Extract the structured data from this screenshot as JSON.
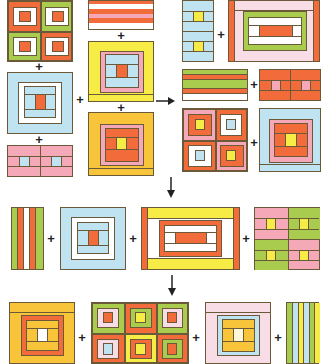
{
  "diagram": {
    "colors": {
      "orange": "#f26b3a",
      "green": "#a9cc4e",
      "white": "#ffffff",
      "pink": "#f5a9b8",
      "lightpink": "#f8dde6",
      "lightblue": "#bfe3f0",
      "yellow": "#f7ec45",
      "gold": "#f8c53a",
      "outline": "#6b5a3a"
    },
    "operators": {
      "plus": "+",
      "arrow_right": "→",
      "arrow_down": "↓"
    },
    "stages": [
      {
        "name": "stage-1",
        "blocks": [
          "four-patch-orange-green",
          "horizontal-strips-orange-pink-white",
          "light-blue-log-cabin",
          "yellow-pink-blue-log-cabin",
          "pink-strip-with-blue-squares",
          "gold-orange-log-cabin",
          "blue-strip-with-yellow-squares",
          "pink-orange-green-rectangle"
        ]
      },
      {
        "name": "stage-2",
        "blocks": [
          "green-orange-strips",
          "orange-strip-with-pink-squares",
          "pink-orange-four-patch",
          "blue-pink-orange-log-cabin"
        ]
      },
      {
        "name": "stage-3",
        "blocks": [
          "vertical-green-orange-white-strips",
          "light-blue-log-cabin",
          "yellow-orange-white-rectangle",
          "pink-green-four-patch-yellow-centers"
        ]
      },
      {
        "name": "stage-4",
        "blocks": [
          "gold-orange-log-cabin-white-center",
          "six-patch-log-cabin",
          "lightpink-blue-gold-log-cabin",
          "vertical-green-blue-yellow-strips"
        ]
      }
    ]
  }
}
